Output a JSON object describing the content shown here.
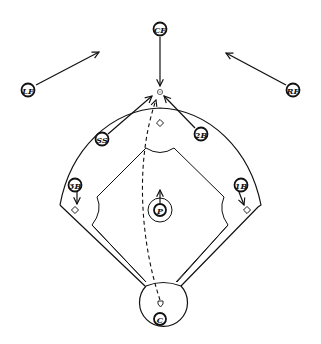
{
  "diagram": {
    "type": "baseball-defensive-play",
    "background": "#ffffff",
    "ink": "#111111",
    "players": [
      {
        "id": "cf",
        "label": "CF",
        "x": 160,
        "y": 29
      },
      {
        "id": "lf",
        "label": "LF",
        "x": 28,
        "y": 90
      },
      {
        "id": "rf",
        "label": "RF",
        "x": 293,
        "y": 90
      },
      {
        "id": "ss",
        "label": "SS",
        "x": 102,
        "y": 139
      },
      {
        "id": "2b",
        "label": "2B",
        "x": 201,
        "y": 134
      },
      {
        "id": "3b",
        "label": "3B",
        "x": 75,
        "y": 185
      },
      {
        "id": "1b",
        "label": "1B",
        "x": 241,
        "y": 185
      },
      {
        "id": "p",
        "label": "P",
        "x": 160,
        "y": 210
      },
      {
        "id": "c",
        "label": "C",
        "x": 160,
        "y": 319
      }
    ],
    "movements": [
      {
        "from": "CF",
        "to": "ball",
        "style": "solid"
      },
      {
        "from": "LF",
        "to": "left-center",
        "style": "solid"
      },
      {
        "from": "RF",
        "to": "right-center",
        "style": "solid"
      },
      {
        "from": "SS",
        "to": "ball",
        "style": "solid"
      },
      {
        "from": "2B",
        "to": "ball",
        "style": "solid"
      },
      {
        "from": "3B",
        "to": "third-base",
        "style": "solid"
      },
      {
        "from": "1B",
        "to": "first-base",
        "style": "solid"
      },
      {
        "from": "P",
        "to": "forward",
        "style": "solid"
      },
      {
        "from": "home-plate",
        "to": "ball",
        "style": "dashed",
        "meaning": "ball-path"
      }
    ],
    "bases": [
      "first-base",
      "second-base",
      "third-base",
      "home-plate"
    ]
  }
}
